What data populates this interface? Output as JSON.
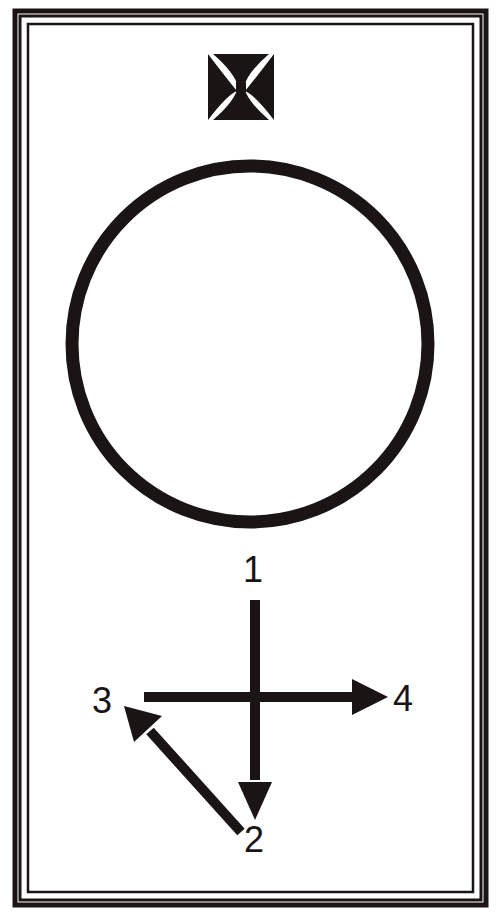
{
  "diagram": {
    "type": "card-diagram",
    "colors": {
      "ink": "#1a1414",
      "background": "#ffffff"
    },
    "frame": {
      "outer_line": "thick",
      "inner_line": "thin",
      "style": "double-border"
    },
    "emblem": {
      "icon": "cross-pattee-icon"
    },
    "circle": {
      "cx": 250,
      "cy": 344,
      "r": 178
    },
    "arrows": [
      {
        "from": "1",
        "to": "2",
        "direction": "down"
      },
      {
        "from": "2",
        "to": "3",
        "direction": "up-left"
      },
      {
        "from": "3",
        "to": "4",
        "direction": "right"
      }
    ],
    "labels": {
      "one": "1",
      "two": "2",
      "three": "3",
      "four": "4"
    }
  }
}
